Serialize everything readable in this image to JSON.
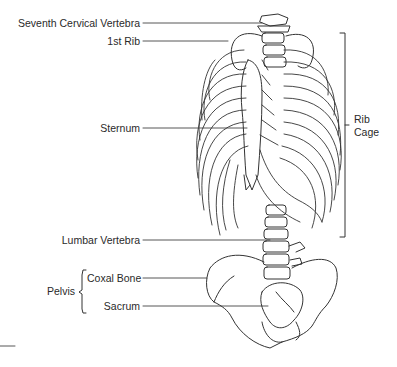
{
  "figure": {
    "labels": {
      "seventh_cervical_vertebra": "Seventh Cervical Vertebra",
      "first_rib": "1st Rib",
      "sternum": "Sternum",
      "rib_cage_line1": "Rib",
      "rib_cage_line2": "Cage",
      "lumbar_vertebra": "Lumbar Vertebra",
      "pelvis": "Pelvis",
      "coxal_bone": "Coxal Bone",
      "sacrum": "Sacrum"
    },
    "colors": {
      "line": "#333333",
      "bone_fill": "#ffffff",
      "text": "#2a2a2a"
    }
  }
}
